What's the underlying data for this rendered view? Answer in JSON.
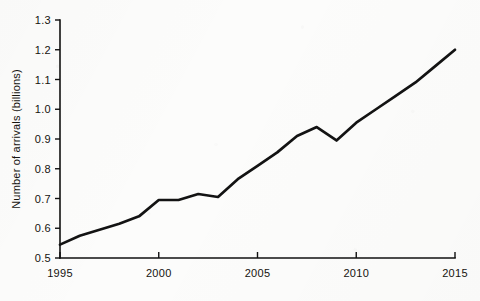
{
  "chart_data": {
    "type": "line",
    "title": "",
    "subtitle": "",
    "xlabel": "",
    "ylabel": "Number of arrivals (billions)",
    "xlim": [
      1995,
      2015
    ],
    "ylim": [
      0.5,
      1.3
    ],
    "grid": false,
    "legend": null,
    "x_tick_labels": [
      "1995",
      "2000",
      "2005",
      "2010",
      "2015"
    ],
    "x_ticks": [
      1995,
      2000,
      2005,
      2010,
      2015
    ],
    "y_tick_labels": [
      "0.5",
      "0.6",
      "0.7",
      "0.8",
      "0.9",
      "1.0",
      "1.1",
      "1.2",
      "1.3"
    ],
    "y_ticks": [
      0.5,
      0.6,
      0.7,
      0.8,
      0.9,
      1.0,
      1.1,
      1.2,
      1.3
    ],
    "line_color": "#131313",
    "background_color": "#fcfcfb",
    "series": [
      {
        "name": "International tourist arrivals",
        "x": [
          1995,
          1996,
          1997,
          1998,
          1999,
          2000,
          2001,
          2002,
          2003,
          2004,
          2005,
          2006,
          2007,
          2008,
          2009,
          2010,
          2011,
          2012,
          2013,
          2014,
          2015
        ],
        "values": [
          0.545,
          0.575,
          0.595,
          0.615,
          0.64,
          0.695,
          0.695,
          0.715,
          0.705,
          0.765,
          0.81,
          0.855,
          0.91,
          0.94,
          0.895,
          0.955,
          1.0,
          1.045,
          1.09,
          1.145,
          1.2
        ]
      }
    ]
  },
  "axis": {
    "y_title": "Number of arrivals (billions)"
  }
}
